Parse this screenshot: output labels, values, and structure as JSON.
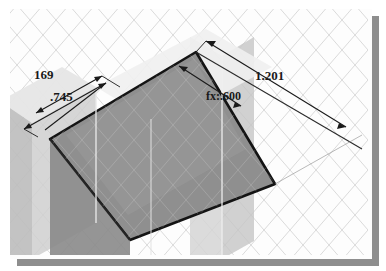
{
  "app": {
    "type": "cad-isometric-sketch-viewport",
    "description": "Isometric CAD modeling viewport showing an extruded rectangular block on a grid work plane with parametric dimensions"
  },
  "viewport": {
    "background_color": "#fdfdfd",
    "border_color": "#5a5a5a",
    "shadow_color": "#8e8e8e",
    "grid": {
      "visible": true,
      "style": "isometric-diamond",
      "line_color": "#d8d8d8"
    }
  },
  "model": {
    "top_face_color": "#8c8c8c",
    "front_face_color": "#9d9d9d",
    "side_face_color": "#b3b3b3",
    "outline_color": "#1c1c1c",
    "ghost_band_color": "#c9c9c9"
  },
  "dimensions": [
    {
      "id": "dim-169",
      "label": "169",
      "value": "169",
      "position": "upper-left",
      "orientation": "left-depth"
    },
    {
      "id": "dim-745",
      "label": ".745",
      "value": ".745",
      "position": "left",
      "orientation": "left-width"
    },
    {
      "id": "dim-fx-600",
      "label": "fx:.600",
      "value": ".600",
      "prefix": "fx:",
      "driven_by_equation": true,
      "position": "center-right",
      "orientation": "top-edge"
    },
    {
      "id": "dim-1201",
      "label": "1.201",
      "value": "1.201",
      "position": "right",
      "orientation": "right-length"
    }
  ],
  "colors": {
    "dimension_line": "#1a1a1a",
    "dimension_text": "#1a1a1a"
  }
}
